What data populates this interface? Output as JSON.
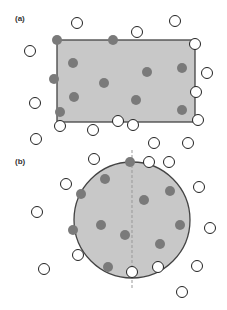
{
  "colors": {
    "region_fill": "#c8c8c8",
    "region_stroke": "#444444",
    "filled_point": "#7a7a7a",
    "open_point_fill": "#ffffff",
    "open_point_stroke": "#222222",
    "divider": "#999999"
  },
  "panels": [
    {
      "label": "(a)",
      "label_pos": [
        15,
        14
      ],
      "shape": "rectangle",
      "rect": {
        "x": 57,
        "y": 40,
        "w": 138,
        "h": 82
      },
      "filled_points": [
        [
          57,
          40
        ],
        [
          113,
          40
        ],
        [
          73,
          63
        ],
        [
          54,
          79
        ],
        [
          104,
          83
        ],
        [
          147,
          72
        ],
        [
          182,
          68
        ],
        [
          74,
          97
        ],
        [
          136,
          100
        ],
        [
          60,
          112
        ],
        [
          182,
          110
        ]
      ],
      "open_points": [
        [
          77,
          23
        ],
        [
          30,
          51
        ],
        [
          137,
          32
        ],
        [
          175,
          21
        ],
        [
          195,
          44
        ],
        [
          207,
          73
        ],
        [
          196,
          92
        ],
        [
          35,
          103
        ],
        [
          60,
          126
        ],
        [
          93,
          130
        ],
        [
          118,
          121
        ],
        [
          133,
          125
        ],
        [
          198,
          120
        ],
        [
          36,
          139
        ],
        [
          154,
          143
        ],
        [
          188,
          143
        ]
      ]
    },
    {
      "label": "(b)",
      "label_pos": [
        15,
        157
      ],
      "shape": "circle",
      "circle": {
        "cx": 132,
        "cy": 220,
        "r": 58
      },
      "divider": {
        "x": 132,
        "y1": 150,
        "y2": 290
      },
      "filled_points": [
        [
          130,
          162
        ],
        [
          105,
          179
        ],
        [
          81,
          194
        ],
        [
          144,
          200
        ],
        [
          170,
          191
        ],
        [
          101,
          225
        ],
        [
          73,
          230
        ],
        [
          125,
          235
        ],
        [
          180,
          225
        ],
        [
          160,
          244
        ],
        [
          108,
          267
        ]
      ],
      "open_points": [
        [
          94,
          159
        ],
        [
          149,
          162
        ],
        [
          169,
          162
        ],
        [
          66,
          184
        ],
        [
          199,
          187
        ],
        [
          37,
          212
        ],
        [
          210,
          228
        ],
        [
          78,
          255
        ],
        [
          44,
          269
        ],
        [
          132,
          272
        ],
        [
          158,
          267
        ],
        [
          197,
          266
        ],
        [
          182,
          292
        ]
      ]
    }
  ]
}
